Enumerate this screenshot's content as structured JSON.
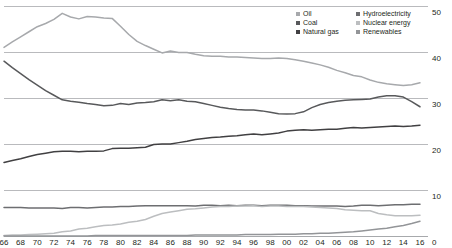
{
  "chart_data": {
    "type": "line",
    "title": "",
    "xlabel": "",
    "ylabel": "",
    "xlim": [
      1966,
      2016
    ],
    "ylim": [
      0,
      50
    ],
    "grid": true,
    "legend_position": "top-right",
    "x": [
      1966,
      1967,
      1968,
      1969,
      1970,
      1971,
      1972,
      1973,
      1974,
      1975,
      1976,
      1977,
      1978,
      1979,
      1980,
      1981,
      1982,
      1983,
      1984,
      1985,
      1986,
      1987,
      1988,
      1989,
      1990,
      1991,
      1992,
      1993,
      1994,
      1995,
      1996,
      1997,
      1998,
      1999,
      2000,
      2001,
      2002,
      2003,
      2004,
      2005,
      2006,
      2007,
      2008,
      2009,
      2010,
      2011,
      2012,
      2013,
      2014,
      2015,
      2016
    ],
    "x_tick_labels": [
      "66",
      "68",
      "70",
      "72",
      "74",
      "76",
      "78",
      "80",
      "82",
      "84",
      "86",
      "88",
      "90",
      "92",
      "94",
      "96",
      "98",
      "00",
      "02",
      "04",
      "06",
      "08",
      "10",
      "12",
      "14",
      "16"
    ],
    "y_tick_labels": [
      "50",
      "40",
      "30",
      "20",
      "10",
      "0"
    ],
    "y_ticks": [
      50,
      40,
      30,
      20,
      10,
      0
    ],
    "series": [
      {
        "name": "Oil",
        "color": "#a7a9ac",
        "values": [
          41.0,
          42.2,
          43.3,
          44.4,
          45.5,
          46.2,
          47.1,
          48.4,
          47.6,
          47.2,
          47.7,
          47.6,
          47.4,
          47.3,
          45.6,
          43.8,
          42.3,
          41.4,
          40.6,
          39.8,
          40.2,
          39.9,
          39.9,
          39.5,
          39.2,
          39.1,
          39.1,
          38.9,
          38.9,
          38.8,
          38.7,
          38.6,
          38.6,
          38.7,
          38.6,
          38.3,
          38.0,
          37.6,
          37.2,
          36.7,
          36.0,
          35.5,
          34.9,
          34.6,
          33.9,
          33.4,
          33.1,
          32.9,
          32.7,
          32.9,
          33.3
        ]
      },
      {
        "name": "Coal",
        "color": "#58595b",
        "values": [
          38.0,
          36.6,
          35.3,
          34.0,
          32.8,
          31.6,
          30.6,
          29.6,
          29.3,
          29.1,
          28.8,
          28.6,
          28.3,
          28.4,
          28.8,
          28.6,
          28.9,
          29.0,
          29.2,
          29.6,
          29.4,
          29.6,
          29.3,
          29.2,
          28.8,
          28.4,
          28.0,
          27.7,
          27.5,
          27.4,
          27.4,
          27.2,
          26.9,
          26.6,
          26.5,
          26.6,
          27.0,
          27.9,
          28.6,
          29.0,
          29.3,
          29.5,
          29.6,
          29.7,
          29.8,
          30.2,
          30.5,
          30.5,
          30.2,
          29.2,
          28.1
        ]
      },
      {
        "name": "Natural gas",
        "color": "#414042",
        "values": [
          16.0,
          16.4,
          16.8,
          17.3,
          17.7,
          18.0,
          18.3,
          18.4,
          18.4,
          18.3,
          18.4,
          18.4,
          18.5,
          19.0,
          19.1,
          19.1,
          19.2,
          19.3,
          19.9,
          20.0,
          20.0,
          20.3,
          20.6,
          21.0,
          21.2,
          21.4,
          21.5,
          21.7,
          21.8,
          22.0,
          22.2,
          22.0,
          22.2,
          22.4,
          22.8,
          23.0,
          23.1,
          23.0,
          23.1,
          23.2,
          23.2,
          23.4,
          23.6,
          23.5,
          23.6,
          23.7,
          23.8,
          23.9,
          23.8,
          23.9,
          24.1
        ]
      },
      {
        "name": "Hydroelectricity",
        "color": "#6d6e71",
        "values": [
          6.2,
          6.2,
          6.2,
          6.1,
          6.1,
          6.1,
          6.1,
          6.0,
          6.2,
          6.2,
          6.1,
          6.2,
          6.3,
          6.3,
          6.4,
          6.4,
          6.5,
          6.6,
          6.6,
          6.6,
          6.6,
          6.6,
          6.6,
          6.5,
          6.7,
          6.7,
          6.6,
          6.7,
          6.6,
          6.7,
          6.7,
          6.6,
          6.7,
          6.7,
          6.7,
          6.6,
          6.6,
          6.5,
          6.5,
          6.5,
          6.5,
          6.4,
          6.5,
          6.7,
          6.7,
          6.6,
          6.7,
          6.8,
          6.8,
          6.9,
          6.9
        ]
      },
      {
        "name": "Nuclear energy",
        "color": "#bcbec0",
        "values": [
          0.1,
          0.2,
          0.2,
          0.3,
          0.4,
          0.5,
          0.6,
          0.9,
          1.1,
          1.5,
          1.7,
          2.0,
          2.3,
          2.4,
          2.6,
          3.0,
          3.2,
          3.6,
          4.3,
          4.9,
          5.2,
          5.5,
          5.8,
          5.9,
          6.1,
          6.3,
          6.4,
          6.4,
          6.5,
          6.5,
          6.6,
          6.4,
          6.5,
          6.5,
          6.4,
          6.4,
          6.4,
          6.3,
          6.2,
          6.1,
          6.0,
          5.7,
          5.6,
          5.5,
          5.5,
          4.9,
          4.6,
          4.4,
          4.4,
          4.4,
          4.5
        ]
      },
      {
        "name": "Renewables",
        "color": "#939598",
        "values": [
          0.0,
          0.0,
          0.0,
          0.0,
          0.0,
          0.0,
          0.0,
          0.0,
          0.0,
          0.0,
          0.0,
          0.1,
          0.1,
          0.1,
          0.1,
          0.1,
          0.1,
          0.1,
          0.1,
          0.1,
          0.1,
          0.1,
          0.1,
          0.2,
          0.2,
          0.2,
          0.2,
          0.2,
          0.2,
          0.3,
          0.3,
          0.3,
          0.3,
          0.4,
          0.4,
          0.4,
          0.5,
          0.5,
          0.6,
          0.6,
          0.7,
          0.8,
          0.9,
          1.1,
          1.3,
          1.5,
          1.7,
          2.0,
          2.3,
          2.7,
          3.2
        ]
      }
    ]
  },
  "legend": {
    "items": [
      {
        "label": "Oil",
        "color": "#a7a9ac"
      },
      {
        "label": "Coal",
        "color": "#58595b"
      },
      {
        "label": "Natural gas",
        "color": "#414042"
      },
      {
        "label": "Hydroelectricity",
        "color": "#6d6e71"
      },
      {
        "label": "Nuclear energy",
        "color": "#bcbec0"
      },
      {
        "label": "Renewables",
        "color": "#939598"
      }
    ]
  },
  "axes": {
    "y_labels": [
      "50",
      "40",
      "30",
      "20",
      "10",
      "0"
    ],
    "x_labels": [
      "66",
      "68",
      "70",
      "72",
      "74",
      "76",
      "78",
      "80",
      "82",
      "84",
      "86",
      "88",
      "90",
      "92",
      "94",
      "96",
      "98",
      "00",
      "02",
      "04",
      "06",
      "08",
      "10",
      "12",
      "14",
      "16"
    ]
  },
  "style": {
    "grid_color": "#a7a9ac",
    "text_color": "#231f20",
    "background": "#ffffff"
  }
}
